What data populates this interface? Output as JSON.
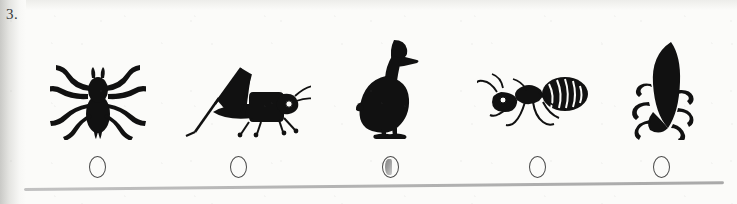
{
  "worksheet": {
    "question_number": "3.",
    "background_color": "#fbfbf9",
    "ink_color": "#111111",
    "rule_color": "#b4b4b4"
  },
  "options": [
    {
      "index": 1,
      "icon": "spider-silhouette",
      "label": "spider",
      "center_x": 97,
      "selected": false
    },
    {
      "index": 2,
      "icon": "grasshopper-silhouette",
      "label": "grasshopper",
      "center_x": 238,
      "selected": false
    },
    {
      "index": 3,
      "icon": "duck-silhouette",
      "label": "duck",
      "center_x": 390,
      "selected": true
    },
    {
      "index": 4,
      "icon": "ant-illustration",
      "label": "ant",
      "center_x": 537,
      "selected": false
    },
    {
      "index": 5,
      "icon": "beetle-silhouette",
      "label": "beetle",
      "center_x": 661,
      "selected": false
    }
  ]
}
